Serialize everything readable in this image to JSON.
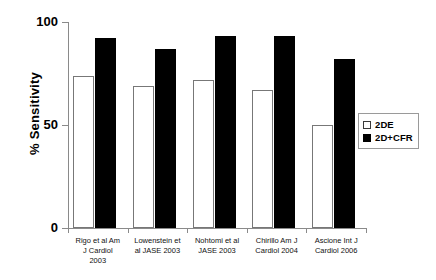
{
  "chart_data": {
    "type": "bar",
    "title": "",
    "subtitle": "",
    "xlabel": "",
    "ylabel": "% Sensitivity",
    "ylim": [
      0,
      100
    ],
    "yticks": [
      0,
      50,
      100
    ],
    "ytick_labels": [
      "0",
      "50",
      "100"
    ],
    "grid": false,
    "legend_position": "right",
    "categories": [
      "Rigo et al Am J Cardiol 2003",
      "Lowenstein et al JASE 2003",
      "Nohtomi et al JASE 2003",
      "Chirillo Am J Cardiol 2004",
      "Ascione Int J Cardiol 2006"
    ],
    "category_lines": [
      [
        "Rigo et al Am",
        "J Cardiol",
        "2003"
      ],
      [
        "Lowenstein et",
        "al JASE 2003"
      ],
      [
        "Nohtomi et al",
        "JASE 2003"
      ],
      [
        "Chirillo Am J",
        "Cardiol 2004"
      ],
      [
        "Ascione Int J",
        "Cardiol 2006"
      ]
    ],
    "series": [
      {
        "name": "2DE",
        "color": "#ffffff",
        "edge_color": "#777777",
        "values": [
          74,
          69,
          72,
          67,
          50
        ]
      },
      {
        "name": "2D+CFR",
        "color": "#000000",
        "edge_color": "#000000",
        "values": [
          92,
          87,
          93,
          93,
          82
        ]
      }
    ]
  },
  "legend": {
    "items": [
      {
        "label": "2DE",
        "swatch": "hollow-square-icon"
      },
      {
        "label": "2D+CFR",
        "swatch": "filled-square-icon"
      }
    ]
  },
  "axes": {
    "y_title": "% Sensitivity",
    "y_ticks": [
      "100",
      "50",
      "0"
    ]
  }
}
